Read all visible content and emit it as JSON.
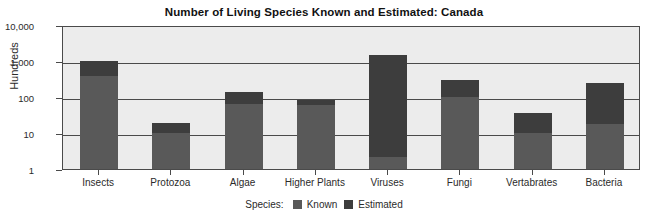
{
  "chart_data": {
    "type": "bar",
    "title": "Number of Living Species Known and Estimated: Canada",
    "xlabel": "",
    "ylabel": "Hundreds",
    "yscale": "log",
    "ylim": [
      1,
      10000
    ],
    "ytick_labels": [
      "10,000",
      "1,000",
      "100",
      "10",
      "1"
    ],
    "ytick_values": [
      10000,
      1000,
      100,
      10,
      1
    ],
    "grid": true,
    "legend_position": "bottom-center",
    "legend_title": "Species:",
    "stacked": true,
    "categories": [
      "Insects",
      "Protozoa",
      "Algae",
      "Higher Plants",
      "Viruses",
      "Fungi",
      "Vertabrates",
      "Bacteria"
    ],
    "series": [
      {
        "name": "Known",
        "color": "#595959",
        "values": [
          390,
          10,
          65,
          60,
          2.2,
          100,
          10,
          18
        ]
      },
      {
        "name": "Estimated",
        "color": "#3d3d3d",
        "values": [
          1000,
          19,
          140,
          85,
          1500,
          300,
          35,
          240
        ]
      }
    ]
  },
  "colors": {
    "plot_background": "#ececec",
    "axis": "#4a4a4a",
    "known": "#595959",
    "estimated": "#3d3d3d",
    "text": "#2b2b2b"
  }
}
